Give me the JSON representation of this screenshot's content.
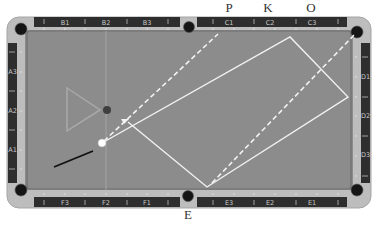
{
  "top_letters": [
    {
      "label": "P",
      "x": 229
    },
    {
      "label": "K",
      "x": 268
    },
    {
      "label": "O",
      "x": 311
    }
  ],
  "bottom_letters": [
    {
      "label": "E",
      "x": 188
    }
  ],
  "rails": {
    "top": [
      "B1",
      "B2",
      "B3",
      "C1",
      "C2",
      "C3"
    ],
    "bottom": [
      "F3",
      "F2",
      "F1",
      "E3",
      "E2",
      "E1"
    ],
    "left": [
      "A3",
      "A2",
      "A1"
    ],
    "right": [
      "D1",
      "D2",
      "D3"
    ]
  },
  "diamond_numbers": {
    "top_left": [
      "0",
      "1",
      "2",
      "3",
      "4",
      "5",
      "6"
    ],
    "top_right": [
      "0",
      "1",
      "2",
      "3",
      "4",
      "5",
      "6"
    ],
    "bottom_left": [
      "6",
      "5",
      "4",
      "3",
      "2",
      "1",
      "0"
    ],
    "bottom_right": [
      "6",
      "5",
      "4",
      "3",
      "2",
      "1",
      "0"
    ]
  },
  "colors": {
    "felt": "#8c8c8c",
    "rim": "#b9b9b9",
    "rail_bar": "#2e2e2e",
    "pocket": "#151515",
    "path": "#f2f2f2",
    "triangle": "#a9a9a9",
    "object_ball": "#3f3f3f",
    "cue_ball": "#ffffff",
    "cue_stick": "#111111"
  },
  "diagram": {
    "cue_ball": {
      "x": 102,
      "y": 143
    },
    "object_ball": {
      "x": 107,
      "y": 110
    },
    "triangle": [
      [
        67,
        88
      ],
      [
        100,
        110
      ],
      [
        67,
        131
      ]
    ],
    "solid_path": [
      [
        102,
        143
      ],
      [
        290,
        37
      ],
      [
        348,
        97
      ],
      [
        207,
        187
      ],
      [
        130,
        123
      ]
    ],
    "dashed_lines": [
      [
        [
          102,
          143
        ],
        [
          218,
          34
        ]
      ],
      [
        [
          212,
          183
        ],
        [
          357,
          32
        ]
      ]
    ],
    "cue_stick": [
      [
        54,
        167
      ],
      [
        93,
        151
      ]
    ],
    "vertical_guide_x": 106
  }
}
